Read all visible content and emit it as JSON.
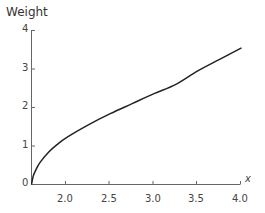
{
  "chart_data": {
    "type": "line",
    "title": "",
    "xlabel": "x",
    "ylabel": "Weight",
    "xlim": [
      1.6,
      4.0
    ],
    "ylim": [
      0,
      4
    ],
    "x_ticks": [
      "2.0",
      "2.5",
      "3.0",
      "3.5",
      "4.0"
    ],
    "y_ticks": [
      "0",
      "1",
      "2",
      "3",
      "4"
    ],
    "grid": false,
    "legend": null,
    "series": [
      {
        "name": "Weight",
        "color": "#222222",
        "x": [
          1.6,
          1.62,
          1.65,
          1.7,
          1.8,
          1.9,
          2.0,
          2.25,
          2.5,
          2.75,
          3.0,
          3.25,
          3.5,
          3.75,
          4.0
        ],
        "values": [
          0.0,
          0.22,
          0.38,
          0.58,
          0.85,
          1.05,
          1.22,
          1.55,
          1.84,
          2.1,
          2.36,
          2.6,
          2.95,
          3.25,
          3.55
        ]
      }
    ]
  }
}
